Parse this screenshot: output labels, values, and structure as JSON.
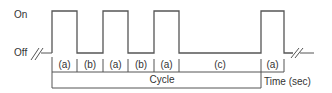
{
  "diagram": {
    "type": "timing-diagram",
    "y_labels": {
      "on": "On",
      "off": "Off"
    },
    "x_label": "Time (sec)",
    "cycle_label": "Cycle",
    "line_color": "#555555",
    "text_color": "#333333",
    "levels": {
      "on_y": 11,
      "off_y": 53
    },
    "pulses": [
      {
        "start": 52,
        "end": 77
      },
      {
        "start": 103,
        "end": 128
      },
      {
        "start": 154,
        "end": 179
      },
      {
        "start": 261,
        "end": 284
      }
    ],
    "segments": [
      {
        "label": "(a)",
        "start": 52,
        "end": 77
      },
      {
        "label": "(b)",
        "start": 77,
        "end": 103
      },
      {
        "label": "(a)",
        "start": 103,
        "end": 128
      },
      {
        "label": "(b)",
        "start": 128,
        "end": 154
      },
      {
        "label": "(a)",
        "start": 154,
        "end": 179
      },
      {
        "label": "(c)",
        "start": 179,
        "end": 261
      },
      {
        "label": "(a)",
        "start": 261,
        "end": 284
      }
    ],
    "cycle": {
      "start": 52,
      "end": 261
    }
  }
}
